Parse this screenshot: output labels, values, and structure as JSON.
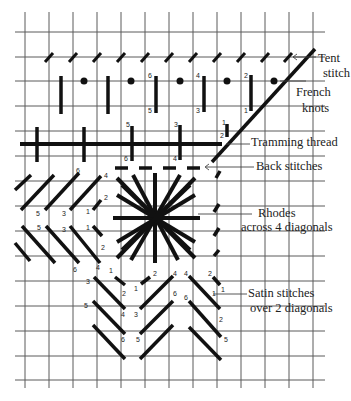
{
  "diagram": {
    "labels": {
      "tent_stitch_1": "Tent",
      "tent_stitch_2": "stitch",
      "french_knots_1": "French",
      "french_knots_2": "knots",
      "tramming_thread": "Tramming thread",
      "back_stitches": "Back stitches",
      "rhodes_1": "Rhodes",
      "rhodes_2": "across 4 diagonals",
      "satin_1": "Satin stitches",
      "satin_2": "over 2 diagonals"
    },
    "grid": {
      "x": [
        25,
        49,
        73,
        97,
        121,
        145,
        169,
        193,
        217,
        241,
        265,
        289,
        313
      ],
      "y": [
        32,
        57,
        81,
        106,
        131,
        156,
        181,
        206,
        231,
        256,
        281,
        306,
        331,
        356,
        380
      ],
      "x_start": 15,
      "x_end": 325,
      "y_start": 12,
      "y_end": 388
    },
    "stitch_numbers": [
      {
        "t": "6",
        "x": 148,
        "y": 78
      },
      {
        "t": "5",
        "x": 148,
        "y": 113
      },
      {
        "t": "4",
        "x": 196,
        "y": 78
      },
      {
        "t": "3",
        "x": 196,
        "y": 113
      },
      {
        "t": "2",
        "x": 244,
        "y": 78
      },
      {
        "t": "1",
        "x": 244,
        "y": 113
      },
      {
        "t": "5",
        "x": 126,
        "y": 127
      },
      {
        "t": "6",
        "x": 124,
        "y": 161
      },
      {
        "t": "3",
        "x": 174,
        "y": 127
      },
      {
        "t": "4",
        "x": 173,
        "y": 161
      },
      {
        "t": "1",
        "x": 222,
        "y": 125
      },
      {
        "t": "2",
        "x": 220,
        "y": 138
      },
      {
        "t": "6",
        "x": 76,
        "y": 173
      },
      {
        "t": "4",
        "x": 104,
        "y": 178
      },
      {
        "t": "2",
        "x": 104,
        "y": 200
      },
      {
        "t": "1",
        "x": 86,
        "y": 214
      },
      {
        "t": "5",
        "x": 36,
        "y": 216
      },
      {
        "t": "3",
        "x": 62,
        "y": 216
      },
      {
        "t": "5",
        "x": 37,
        "y": 230
      },
      {
        "t": "3",
        "x": 62,
        "y": 232
      },
      {
        "t": "1",
        "x": 86,
        "y": 230
      },
      {
        "t": "2",
        "x": 101,
        "y": 250
      },
      {
        "t": "6",
        "x": 73,
        "y": 272
      },
      {
        "t": "4",
        "x": 96,
        "y": 270
      },
      {
        "t": "3",
        "x": 86,
        "y": 284
      },
      {
        "t": "1",
        "x": 109,
        "y": 273
      },
      {
        "t": "2",
        "x": 122,
        "y": 296
      },
      {
        "t": "1",
        "x": 134,
        "y": 291
      },
      {
        "t": "2",
        "x": 153,
        "y": 276
      },
      {
        "t": "4",
        "x": 173,
        "y": 276
      },
      {
        "t": "4",
        "x": 184,
        "y": 276
      },
      {
        "t": "2",
        "x": 208,
        "y": 276
      },
      {
        "t": "1",
        "x": 221,
        "y": 292
      },
      {
        "t": "5",
        "x": 84,
        "y": 308
      },
      {
        "t": "4",
        "x": 121,
        "y": 317
      },
      {
        "t": "3",
        "x": 134,
        "y": 317
      },
      {
        "t": "6",
        "x": 173,
        "y": 296
      },
      {
        "t": "6",
        "x": 184,
        "y": 300
      },
      {
        "t": "1",
        "x": 212,
        "y": 296
      },
      {
        "t": "2",
        "x": 219,
        "y": 322
      },
      {
        "t": "6",
        "x": 121,
        "y": 342
      },
      {
        "t": "5",
        "x": 136,
        "y": 342
      },
      {
        "t": "5",
        "x": 224,
        "y": 342
      }
    ]
  }
}
